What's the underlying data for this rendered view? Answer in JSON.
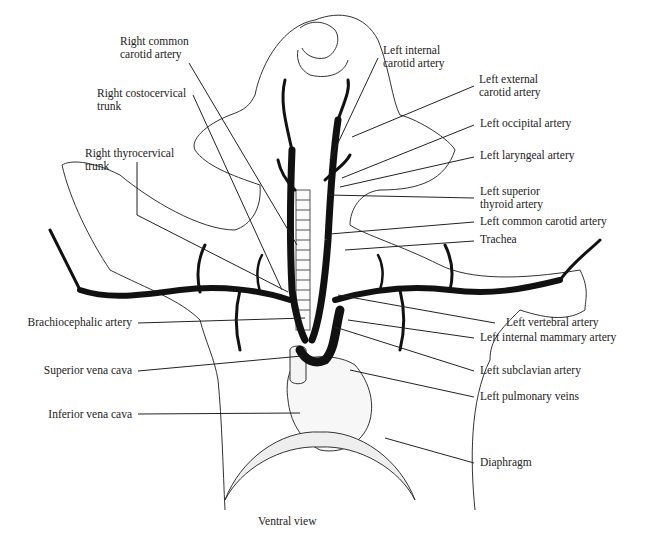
{
  "diagram": {
    "view_caption": "Ventral view",
    "labels_left": [
      {
        "id": "right-common-carotid",
        "text": "Right common\ncarotid artery"
      },
      {
        "id": "right-costocervical",
        "text": "Right costocervical\ntrunk"
      },
      {
        "id": "right-thyrocervical",
        "text": "Right thyrocervical\ntrunk"
      },
      {
        "id": "brachiocephalic",
        "text": "Brachiocephalic artery"
      },
      {
        "id": "superior-vena-cava",
        "text": "Superior vena cava"
      },
      {
        "id": "inferior-vena-cava",
        "text": "Inferior vena cava"
      }
    ],
    "labels_right": [
      {
        "id": "left-internal-carotid",
        "text": "Left internal\ncarotid artery"
      },
      {
        "id": "left-external-carotid",
        "text": "Left external\ncarotid artery"
      },
      {
        "id": "left-occipital",
        "text": "Left occipital artery"
      },
      {
        "id": "left-laryngeal",
        "text": "Left laryngeal artery"
      },
      {
        "id": "left-superior-thyroid",
        "text": "Left superior\nthyroid artery"
      },
      {
        "id": "left-common-carotid",
        "text": "Left common carotid artery"
      },
      {
        "id": "trachea",
        "text": "Trachea"
      },
      {
        "id": "left-vertebral",
        "text": "Left vertebral artery"
      },
      {
        "id": "left-internal-mammary",
        "text": "Left internal mammary artery"
      },
      {
        "id": "left-subclavian",
        "text": "Left subclavian artery"
      },
      {
        "id": "left-pulmonary-veins",
        "text": "Left pulmonary veins"
      },
      {
        "id": "diaphragm",
        "text": "Diaphragm"
      }
    ],
    "colors": {
      "ink": "#1a1a1a",
      "outline": "#333333",
      "vessel": "#111111"
    }
  }
}
